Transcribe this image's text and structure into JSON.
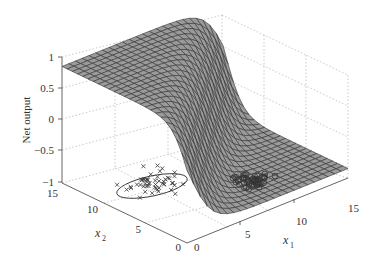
{
  "chart_data": {
    "type": "surface3d",
    "title": "",
    "zlabel": "Net output",
    "xlabel": "x1",
    "ylabel": "x2",
    "xlim": [
      0,
      15
    ],
    "ylim": [
      0,
      15
    ],
    "zlim": [
      -1,
      1
    ],
    "xticks": [
      "0",
      "5",
      "10",
      "15"
    ],
    "yticks": [
      "0",
      "5",
      "10",
      "15"
    ],
    "zticks": [
      "1",
      "0.5",
      "0",
      "-0.5",
      "-1"
    ],
    "grid": true,
    "surface": {
      "description": "Sigmoid-like decision surface: ~0.85 for small x1 / large x2 region, decreasing to ~-0.8 for large x1",
      "color": "#9a9a9a",
      "edge_color": "#333333"
    },
    "series": [
      {
        "name": "class 1 (x markers)",
        "marker": "x",
        "center": [
          5,
          10
        ],
        "count": 50
      },
      {
        "name": "class 2 (o markers)",
        "marker": "o",
        "center": [
          10,
          5
        ],
        "count": 50
      }
    ],
    "annotations": [
      "ellipse around x-marker cluster"
    ]
  },
  "labels": {
    "zlabel": "Net output",
    "x1_base": "x",
    "x1_sub": "1",
    "x2_base": "x",
    "x2_sub": "2",
    "z_ticks": [
      "1",
      "0.5",
      "0",
      "−0.5",
      "−1"
    ],
    "x2_ticks": [
      "15",
      "10",
      "5",
      "0"
    ],
    "x1_ticks": [
      "0",
      "5",
      "10",
      "15"
    ]
  }
}
